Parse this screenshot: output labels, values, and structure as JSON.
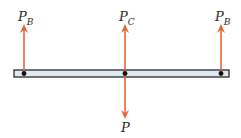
{
  "diagram": {
    "labels": {
      "left_force": {
        "main": "P",
        "sub": "B"
      },
      "center_force": {
        "main": "P",
        "sub": "C"
      },
      "right_force": {
        "main": "P",
        "sub": "B"
      },
      "applied_load": {
        "main": "P",
        "sub": ""
      }
    },
    "colors": {
      "arrow": "#e8643c",
      "beam_fill": "#dfe9f1",
      "beam_border": "#1a1a1a",
      "pin": "#111111"
    }
  }
}
